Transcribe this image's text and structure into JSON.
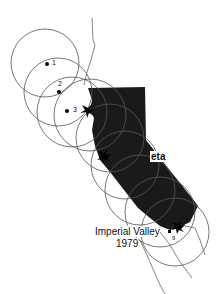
{
  "map": {
    "region": "California",
    "fill_color": "#1a1a1a",
    "circle_color": "#555555",
    "stations": [
      {
        "label": "1",
        "x": 47,
        "y": 64
      },
      {
        "label": "2",
        "x": 59,
        "y": 92
      },
      {
        "label": "3",
        "x": 67,
        "y": 111
      },
      {
        "label": "9",
        "x": 170,
        "y": 232
      }
    ],
    "earthquakes": [
      {
        "name": "Loma Prieta",
        "visible_text": "eta",
        "x": 104,
        "y": 157
      },
      {
        "name": "Imperial Valley",
        "year": "1979",
        "x": 172,
        "y": 232
      }
    ]
  },
  "labels": {
    "station_1": "1",
    "station_2": "2",
    "station_3": "3",
    "station_9": "9",
    "loma_prieta": "eta",
    "imperial_valley": "Imperial Valley",
    "imperial_valley_year": "1979"
  }
}
